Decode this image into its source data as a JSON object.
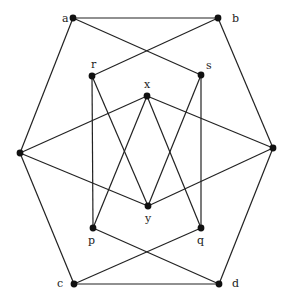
{
  "diagram": {
    "type": "graph",
    "style": {
      "edge_color": "#222222",
      "node_color": "#111111",
      "background": "#ffffff"
    },
    "nodes": [
      {
        "id": "a",
        "label": "a",
        "x": 73,
        "y": 18,
        "lx": 62,
        "ly": 22
      },
      {
        "id": "b",
        "label": "b",
        "x": 218,
        "y": 18,
        "lx": 232,
        "ly": 22
      },
      {
        "id": "r",
        "label": "r",
        "x": 92,
        "y": 76,
        "lx": 91,
        "ly": 68
      },
      {
        "id": "s",
        "label": "s",
        "x": 201,
        "y": 75,
        "lx": 206,
        "ly": 69
      },
      {
        "id": "x",
        "label": "x",
        "x": 147,
        "y": 96,
        "lx": 144,
        "ly": 88
      },
      {
        "id": "w",
        "label": "",
        "x": 20,
        "y": 153,
        "lx": 22,
        "ly": 142
      },
      {
        "id": "z",
        "label": "",
        "x": 273,
        "y": 148,
        "lx": 278,
        "ly": 142
      },
      {
        "id": "y",
        "label": "y",
        "x": 148,
        "y": 206,
        "lx": 145,
        "ly": 222
      },
      {
        "id": "p",
        "label": "p",
        "x": 93,
        "y": 228,
        "lx": 88,
        "ly": 244
      },
      {
        "id": "q",
        "label": "q",
        "x": 201,
        "y": 228,
        "lx": 197,
        "ly": 244
      },
      {
        "id": "c",
        "label": "c",
        "x": 74,
        "y": 284,
        "lx": 57,
        "ly": 287
      },
      {
        "id": "d",
        "label": "d",
        "x": 219,
        "y": 284,
        "lx": 232,
        "ly": 287
      }
    ],
    "edges": [
      [
        "a",
        "b"
      ],
      [
        "a",
        "w"
      ],
      [
        "a",
        "s"
      ],
      [
        "b",
        "z"
      ],
      [
        "b",
        "r"
      ],
      [
        "r",
        "p"
      ],
      [
        "r",
        "y"
      ],
      [
        "s",
        "q"
      ],
      [
        "s",
        "y"
      ],
      [
        "x",
        "w"
      ],
      [
        "x",
        "z"
      ],
      [
        "x",
        "p"
      ],
      [
        "x",
        "q"
      ],
      [
        "w",
        "y"
      ],
      [
        "z",
        "y"
      ],
      [
        "w",
        "c"
      ],
      [
        "z",
        "d"
      ],
      [
        "p",
        "d"
      ],
      [
        "q",
        "c"
      ],
      [
        "c",
        "d"
      ]
    ]
  }
}
